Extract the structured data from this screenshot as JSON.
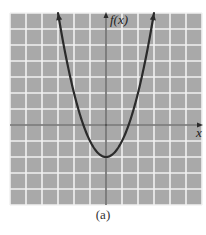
{
  "chart_data": {
    "type": "line",
    "title": "",
    "caption": "(a)",
    "xlabel": "x",
    "ylabel": "f(x)",
    "function": "f(x) = x^2 - 2",
    "xlim": [
      -6,
      6
    ],
    "ylim": [
      -5,
      7
    ],
    "grid": true,
    "grid_step": 1,
    "tick_labels": false,
    "series": [
      {
        "name": "f(x)",
        "x": [
          -3,
          -2.5,
          -2,
          -1.5,
          -1.414,
          -1,
          -0.5,
          0,
          0.5,
          1,
          1.414,
          1.5,
          2,
          2.5,
          3
        ],
        "y": [
          7,
          4.25,
          2,
          0.25,
          0,
          -1,
          -1.75,
          -2,
          -1.75,
          -1,
          0,
          0.25,
          2,
          4.25,
          7
        ]
      }
    ],
    "features": {
      "vertex": [
        0,
        -2
      ],
      "x_intercepts": [
        -1.414,
        1.414
      ],
      "y_intercept": -2,
      "arrows_on_curve_ends": true,
      "arrows_on_axes": [
        "positive-x",
        "positive-y"
      ]
    }
  },
  "colors": {
    "plot_background": "#a9a9a9",
    "grid_line": "#f2f2f2",
    "curve": "#2b2b2b",
    "axis": "#2b2b2b",
    "page_background": "#ffffff"
  },
  "labels": {
    "y_axis": "f(x)",
    "x_axis": "x",
    "caption": "(a)"
  }
}
